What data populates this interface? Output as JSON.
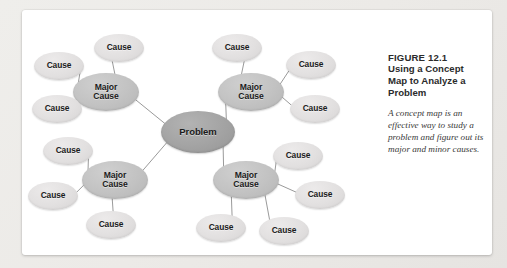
{
  "figure": {
    "number": "FIGURE 12.1",
    "title": "Using a Concept Map to Analyze a Problem",
    "description": "A concept map is an effective way to study a problem and figure out its major and minor causes."
  },
  "colors": {
    "page_background": "#efeeec",
    "card_background": "#ffffff",
    "problem_node": "#a3a3a3",
    "major_cause_node": "#c2c2c2",
    "cause_node": "#e2e0e0",
    "connector_line": "#9a9a9a",
    "heading_text": "#2b2b2b",
    "caption_text": "#3a3a3a"
  },
  "diagram": {
    "type": "concept-map",
    "center": {
      "label": "Problem",
      "x": 176,
      "y": 122,
      "rx": 37,
      "ry": 21
    },
    "major_causes": [
      {
        "id": "major-cause-top-left",
        "label_line1": "Major",
        "label_line2": "Cause",
        "x": 84,
        "y": 82,
        "rx": 33,
        "ry": 19,
        "causes": [
          {
            "id": "cause-tl-1",
            "label": "Cause",
            "x": 37,
            "y": 56,
            "rx": 25,
            "ry": 14
          },
          {
            "id": "cause-tl-2",
            "label": "Cause",
            "x": 35,
            "y": 99,
            "rx": 25,
            "ry": 14
          },
          {
            "id": "cause-tl-3",
            "label": "Cause",
            "x": 97,
            "y": 38,
            "rx": 25,
            "ry": 14
          }
        ]
      },
      {
        "id": "major-cause-top-right",
        "label_line1": "Major",
        "label_line2": "Cause",
        "x": 229,
        "y": 82,
        "rx": 33,
        "ry": 19,
        "causes": [
          {
            "id": "cause-tr-1",
            "label": "Cause",
            "x": 215,
            "y": 38,
            "rx": 25,
            "ry": 14
          },
          {
            "id": "cause-tr-2",
            "label": "Cause",
            "x": 289,
            "y": 55,
            "rx": 25,
            "ry": 14
          },
          {
            "id": "cause-tr-3",
            "label": "Cause",
            "x": 293,
            "y": 99,
            "rx": 25,
            "ry": 14
          }
        ]
      },
      {
        "id": "major-cause-bottom-left",
        "label_line1": "Major",
        "label_line2": "Cause",
        "x": 93,
        "y": 170,
        "rx": 33,
        "ry": 19,
        "causes": [
          {
            "id": "cause-bl-1",
            "label": "Cause",
            "x": 46,
            "y": 141,
            "rx": 25,
            "ry": 14
          },
          {
            "id": "cause-bl-2",
            "label": "Cause",
            "x": 31,
            "y": 186,
            "rx": 25,
            "ry": 14
          },
          {
            "id": "cause-bl-3",
            "label": "Cause",
            "x": 89,
            "y": 215,
            "rx": 25,
            "ry": 14
          }
        ]
      },
      {
        "id": "major-cause-bottom-right",
        "label_line1": "Major",
        "label_line2": "Cause",
        "x": 224,
        "y": 170,
        "rx": 33,
        "ry": 19,
        "causes": [
          {
            "id": "cause-br-1",
            "label": "Cause",
            "x": 276,
            "y": 146,
            "rx": 25,
            "ry": 14
          },
          {
            "id": "cause-br-2",
            "label": "Cause",
            "x": 298,
            "y": 185,
            "rx": 25,
            "ry": 14
          },
          {
            "id": "cause-br-3",
            "label": "Cause",
            "x": 199,
            "y": 218,
            "rx": 25,
            "ry": 14
          },
          {
            "id": "cause-br-4",
            "label": "Cause",
            "x": 262,
            "y": 221,
            "rx": 25,
            "ry": 14
          }
        ]
      }
    ]
  }
}
